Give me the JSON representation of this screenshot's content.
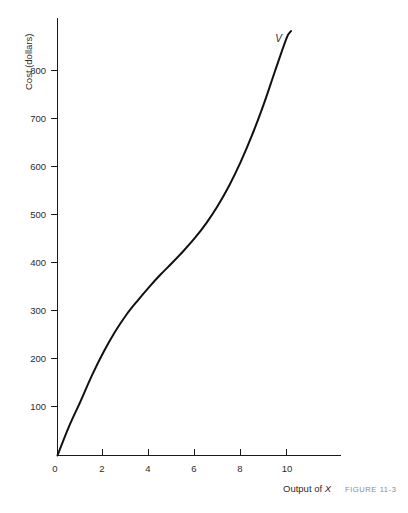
{
  "chart_data": {
    "type": "line",
    "title": "",
    "xlabel": "Output of X",
    "ylabel": "Cost (dollars)",
    "xlim": [
      0,
      12.5
    ],
    "ylim": [
      0,
      900
    ],
    "grid": false,
    "legend_position": "inline-curve-label",
    "x_ticks": [
      0,
      2,
      4,
      6,
      8,
      10
    ],
    "x_tick_labels": [
      "0",
      "2",
      "4",
      "6",
      "8",
      "10"
    ],
    "y_ticks": [
      100,
      200,
      300,
      400,
      500,
      600,
      700,
      800
    ],
    "y_tick_labels": [
      "100",
      "200",
      "300",
      "400",
      "500",
      "600",
      "700",
      "800"
    ],
    "series": [
      {
        "name": "V",
        "label": "V",
        "color": "#111111",
        "x": [
          0,
          0.5,
          1,
          1.5,
          2,
          2.5,
          3,
          3.5,
          4,
          4.5,
          5,
          5.5,
          6,
          6.5,
          7,
          7.5,
          8,
          8.5,
          9,
          9.5,
          10,
          10.2
        ],
        "y": [
          0,
          60,
          112,
          166,
          214,
          256,
          292,
          322,
          350,
          376,
          400,
          425,
          452,
          483,
          519,
          561,
          610,
          666,
          729,
          799,
          867,
          882
        ]
      }
    ],
    "annotations": [
      {
        "text": "V",
        "x": 9.65,
        "y": 860,
        "style": "italic"
      }
    ]
  },
  "labels": {
    "y_axis_title": "Cost (dollars)",
    "x_axis_title_prefix": "Output of ",
    "x_axis_title_variable": "X",
    "curve_label": "V",
    "figure_caption": "FIGURE  11-3"
  },
  "colors": {
    "curve": "#111111",
    "axis": "#1a1a1a",
    "text": "#2b2b2b",
    "caption": "#8a8a8a",
    "background": "#ffffff"
  }
}
